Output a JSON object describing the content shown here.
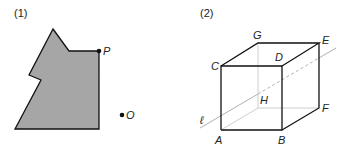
{
  "figure1": {
    "label": "(1)",
    "shape_fill": "#a6a6a6",
    "stroke": "#111111",
    "polygon_points": "53,29 69,51 99,51 99,129 15,129 41,80 29,75",
    "point_P": {
      "name": "P",
      "x": 99,
      "y": 51
    },
    "point_O": {
      "name": "O",
      "x": 122,
      "y": 115
    }
  },
  "figure2": {
    "label": "(2)",
    "vertices": {
      "A": {
        "name": "A",
        "x": 221,
        "y": 130
      },
      "B": {
        "name": "B",
        "x": 282,
        "y": 130
      },
      "C": {
        "name": "C",
        "x": 221,
        "y": 66
      },
      "D": {
        "name": "D",
        "x": 282,
        "y": 66
      },
      "E": {
        "name": "E",
        "x": 319,
        "y": 43
      },
      "F": {
        "name": "F",
        "x": 319,
        "y": 108
      },
      "G": {
        "name": "G",
        "x": 258,
        "y": 43
      },
      "H": {
        "name": "H",
        "x": 258,
        "y": 108
      }
    },
    "line_label": "ℓ",
    "line_color": "#b0b0b0",
    "hidden_edge_color": "#c8c8c8"
  }
}
